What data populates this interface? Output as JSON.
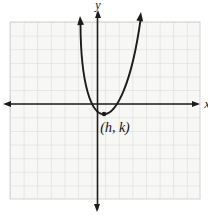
{
  "figure": {
    "labels": {
      "y_axis": "y",
      "x_axis": "x",
      "vertex": "(h, k)"
    }
  },
  "colors": {
    "background": "#ffffff",
    "grid_bg": "#f7f7f5",
    "grid_line": "#cfcfcf",
    "axis": "#1c1c1c",
    "curve": "#1c1c1c",
    "label": "#111111"
  }
}
